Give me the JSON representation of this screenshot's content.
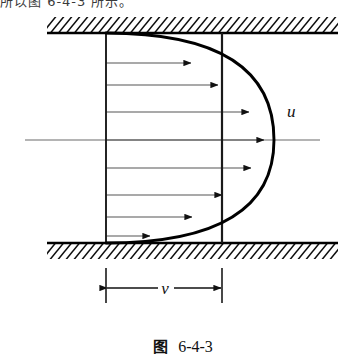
{
  "figure": {
    "top_text_fragment": "所以图 6-4-3 所示。",
    "caption_label": "图",
    "caption_number": "6-4-3",
    "labels": {
      "velocity_profile": "u",
      "mean_velocity": "v"
    },
    "colors": {
      "ink": "#000000",
      "thin_line": "#555555",
      "background": "#ffffff"
    },
    "geometry": {
      "top_wall_y": 33,
      "bottom_wall_y": 243,
      "wall_x_start": 47,
      "wall_x_end": 338,
      "left_vertical_x": 106,
      "right_vertical_x": 222,
      "centerline_y": 140,
      "centerline_x_start": 25,
      "centerline_x_end": 320,
      "curve_apex_x": 274,
      "dimension_y": 288
    },
    "arrows": {
      "count": 9,
      "rows_y": [
        63,
        85,
        112,
        140,
        168,
        195,
        217,
        236
      ],
      "description": "horizontal velocity vectors from left vertical line to parabolic profile"
    }
  }
}
